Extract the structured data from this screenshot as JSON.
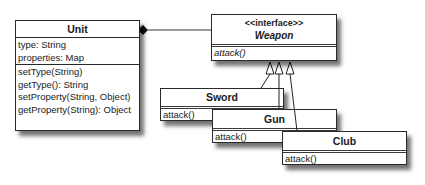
{
  "diagram": {
    "type": "uml-class-diagram",
    "classes": {
      "unit": {
        "name": "Unit",
        "attributes": [
          "type: String",
          "properties: Map"
        ],
        "operations": [
          "setType(String)",
          "getType(): String",
          "setProperty(String, Object)",
          "getProperty(String): Object"
        ]
      },
      "weapon": {
        "stereotype": "<<interface>>",
        "name": "Weapon",
        "operations": [
          "attack()"
        ]
      },
      "sword": {
        "name": "Sword",
        "operations": [
          "attack()"
        ]
      },
      "gun": {
        "name": "Gun",
        "operations": [
          "attack()"
        ]
      },
      "club": {
        "name": "Club",
        "operations": [
          "attack()"
        ]
      }
    },
    "relationships": [
      {
        "from": "Unit",
        "to": "Weapon",
        "kind": "composition"
      },
      {
        "from": "Sword",
        "to": "Weapon",
        "kind": "realization"
      },
      {
        "from": "Gun",
        "to": "Weapon",
        "kind": "realization"
      },
      {
        "from": "Club",
        "to": "Weapon",
        "kind": "realization"
      }
    ],
    "colors": {
      "line": "#2a2a2a",
      "box_fill": "#ffffff",
      "shadow": "#555555"
    }
  }
}
